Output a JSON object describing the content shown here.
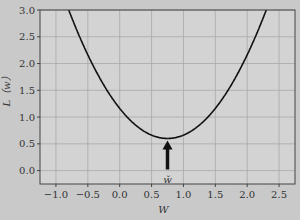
{
  "chart_data": {
    "type": "line",
    "title": "",
    "xlabel": "W",
    "ylabel": "L（w）",
    "xlim": [
      -1.25,
      2.75
    ],
    "ylim": [
      -0.25,
      3.0
    ],
    "xticks": [
      -1.0,
      -0.5,
      0.0,
      0.5,
      1.0,
      1.5,
      2.0,
      2.5
    ],
    "xtick_labels": [
      "−1.0",
      "−0.5",
      "0.0",
      "0.5",
      "1.0",
      "1.5",
      "2.0",
      "2.5"
    ],
    "yticks": [
      0.0,
      0.5,
      1.0,
      1.5,
      2.0,
      2.5,
      3.0
    ],
    "ytick_labels": [
      "0.0",
      "0.5",
      "1.0",
      "1.5",
      "2.0",
      "2.5",
      "3.0"
    ],
    "grid": true,
    "series": [
      {
        "name": "L(w)",
        "function": "0.6 + 1.0*(w - 0.75)^2",
        "x": [
          -0.8,
          -0.5,
          -0.25,
          0.0,
          0.25,
          0.5,
          0.75,
          1.0,
          1.25,
          1.5,
          1.75,
          2.0,
          2.3
        ],
        "values": [
          3.0,
          2.16,
          1.6,
          1.16,
          0.85,
          0.66,
          0.6,
          0.66,
          0.85,
          1.16,
          1.6,
          2.16,
          3.0
        ]
      }
    ],
    "annotations": [
      {
        "type": "arrow",
        "label": "w̌",
        "x": 0.75,
        "y": 0.6,
        "description": "arrow pointing up to minimum"
      }
    ]
  },
  "colors": {
    "background": "#c9c9c9",
    "plot_background": "#d3d3d3",
    "grid": "#a8a8a8",
    "curve": "#111111",
    "frame": "#444444"
  }
}
